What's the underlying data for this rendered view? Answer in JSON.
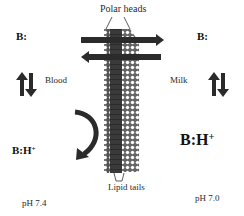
{
  "diagram": {
    "membrane": {
      "top_label": "Polar heads",
      "bottom_label": "Lipid tails"
    },
    "left": {
      "compartment": "Blood",
      "base_label": "B:",
      "conj_label": "B:H",
      "conj_charge": "+",
      "ph_label": "pH 7.4"
    },
    "right": {
      "compartment": "Milk",
      "base_label": "B:",
      "conj_label": "B:H",
      "conj_charge": "+",
      "ph_label": "pH 7.0"
    },
    "colors": {
      "arrow": "#2b2b2b",
      "membrane_core": "#3a3a3a",
      "polar_head_fill": "#ffffff",
      "text": "#1a1a1a"
    }
  }
}
